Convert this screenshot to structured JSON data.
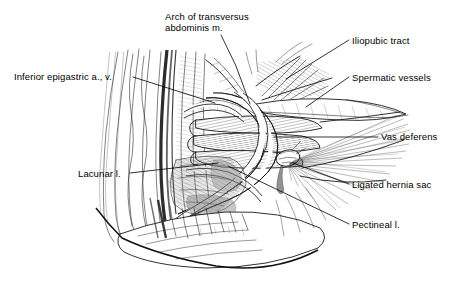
{
  "figure": {
    "kind": "anatomical-line-illustration",
    "background_color": "#ffffff",
    "ink_color": "#000000",
    "width": 462,
    "height": 296
  },
  "labels": [
    {
      "id": "arch-of-transversus-abdominis",
      "lines": [
        "Arch of transversus",
        "abdominis m."
      ],
      "text_x": 165,
      "text_y": 20,
      "line_height": 11,
      "anchor": "start",
      "leader": "M 221 35 L 236 66 L 250 104"
    },
    {
      "id": "iliopubic-tract",
      "lines": [
        "Iliopubic tract"
      ],
      "text_x": 352,
      "text_y": 44,
      "line_height": 11,
      "anchor": "start",
      "leader": "M 349 40 L 286 79"
    },
    {
      "id": "inferior-epigastric",
      "lines": [
        "Inferior epigastric a., v."
      ],
      "text_x": 14,
      "text_y": 80,
      "line_height": 11,
      "anchor": "start",
      "leader": "M 133 77 L 215 103"
    },
    {
      "id": "spermatic-vessels",
      "lines": [
        "Spermatic vessels"
      ],
      "text_x": 352,
      "text_y": 81,
      "line_height": 11,
      "anchor": "start",
      "leader": "M 349 77 L 306 107"
    },
    {
      "id": "vas-deferens",
      "lines": [
        "Vas deferens"
      ],
      "text_x": 381,
      "text_y": 140,
      "line_height": 11,
      "anchor": "start",
      "leader": "M 378 137 L 274 137"
    },
    {
      "id": "lacunar-ligament",
      "lines": [
        "Lacunar l."
      ],
      "text_x": 78,
      "text_y": 177,
      "line_height": 11,
      "anchor": "start",
      "leader": "M 130 173 L 218 163"
    },
    {
      "id": "ligated-hernia-sac",
      "lines": [
        "Ligated hernia sac"
      ],
      "text_x": 352,
      "text_y": 188,
      "line_height": 11,
      "anchor": "start",
      "leader": "M 349 184 L 293 163"
    },
    {
      "id": "pectineal-ligament",
      "lines": [
        "Pectineal l."
      ],
      "text_x": 352,
      "text_y": 228,
      "line_height": 11,
      "anchor": "start",
      "leader": "M 349 224 L 228 166"
    }
  ]
}
